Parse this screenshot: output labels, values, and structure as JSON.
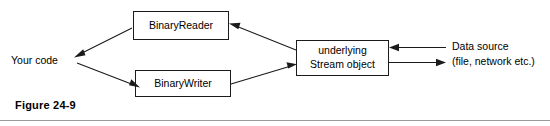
{
  "figure": {
    "caption": "Figure 24-9",
    "colors": {
      "stroke": "#1b1b1b",
      "box_fill": "#ffffff",
      "text": "#000000",
      "rule": "#9b9b9b",
      "background": "#ffffff"
    }
  },
  "nodes": {
    "your_code": {
      "label": "Your code",
      "shape": "text-only"
    },
    "binary_reader": {
      "label": "BinaryReader",
      "shape": "rectangle"
    },
    "binary_writer": {
      "label": "BinaryWriter",
      "shape": "rectangle"
    },
    "stream_object": {
      "label_line1": "underlying",
      "label_line2": "Stream object",
      "shape": "rectangle"
    },
    "data_source": {
      "label_line1": "Data source",
      "label_line2": "(file, network etc.)",
      "shape": "text-only"
    }
  },
  "edges": [
    {
      "id": "stream-to-reader",
      "from": "stream_object",
      "to": "binary_reader",
      "direction": "one-way",
      "style": "diagonal"
    },
    {
      "id": "reader-to-your-code",
      "from": "binary_reader",
      "to": "your_code",
      "direction": "one-way",
      "style": "diagonal"
    },
    {
      "id": "your-code-to-writer",
      "from": "your_code",
      "to": "binary_writer",
      "direction": "one-way",
      "style": "diagonal"
    },
    {
      "id": "writer-to-stream",
      "from": "binary_writer",
      "to": "stream_object",
      "direction": "one-way",
      "style": "diagonal"
    },
    {
      "id": "data-source-to-stream",
      "from": "data_source",
      "to": "stream_object",
      "direction": "one-way",
      "style": "horizontal"
    },
    {
      "id": "stream-to-data-source",
      "from": "stream_object",
      "to": "data_source",
      "direction": "one-way",
      "style": "horizontal"
    }
  ]
}
